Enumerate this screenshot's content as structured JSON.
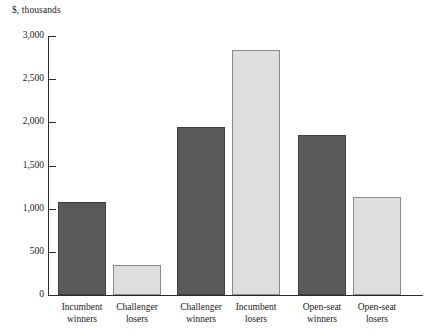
{
  "chart_data": {
    "type": "bar",
    "title": "",
    "subtitle": "",
    "xlabel": "",
    "ylabel": "$, thousands",
    "ylim": [
      0,
      3000
    ],
    "grid": false,
    "legend": null,
    "categories": [
      "Incumbent winners",
      "Challenger losers",
      "Challenger winners",
      "Incumbent losers",
      "Open-seat winners",
      "Open-seat losers"
    ],
    "values": [
      1080,
      350,
      1950,
      2840,
      1855,
      1140
    ],
    "bar_colors": [
      "#595959",
      "#dedede",
      "#595959",
      "#dedede",
      "#595959",
      "#dedede"
    ],
    "ytick_values": [
      0,
      500,
      1000,
      1500,
      2000,
      2500,
      3000
    ],
    "ytick_labels": [
      "0",
      "500",
      "1,000",
      "1,500",
      "2,000",
      "2,500",
      "3,000"
    ],
    "groups": [
      {
        "name": "Incumbent winners / Challenger losers",
        "categories": [
          "Incumbent winners",
          "Challenger losers"
        ]
      },
      {
        "name": "Challenger winners / Incumbent losers",
        "categories": [
          "Challenger winners",
          "Incumbent losers"
        ]
      },
      {
        "name": "Open-seat winners / Open-seat losers",
        "categories": [
          "Open-seat winners",
          "Open-seat losers"
        ]
      }
    ]
  },
  "axis": {
    "y_title": "$, thousands",
    "ticks": [
      {
        "label": "3,000",
        "value": 3000
      },
      {
        "label": "2,500",
        "value": 2500
      },
      {
        "label": "2,000",
        "value": 2000
      },
      {
        "label": "1,500",
        "value": 1500
      },
      {
        "label": "1,000",
        "value": 1000
      },
      {
        "label": "500",
        "value": 500
      },
      {
        "label": "0",
        "value": 0
      }
    ]
  },
  "x_labels": [
    {
      "line1": "Incumbent",
      "line2": "winners"
    },
    {
      "line1": "Challenger",
      "line2": "losers"
    },
    {
      "line1": "Challenger",
      "line2": "winners"
    },
    {
      "line1": "Incumbent",
      "line2": "losers"
    },
    {
      "line1": "Open-seat",
      "line2": "winners"
    },
    {
      "line1": "Open-seat",
      "line2": "losers"
    }
  ],
  "colors": {
    "dark_bar": "#595959",
    "light_bar": "#dedede",
    "axis": "#2b2b2b",
    "text": "#1a1a1a",
    "background": "#ffffff"
  }
}
